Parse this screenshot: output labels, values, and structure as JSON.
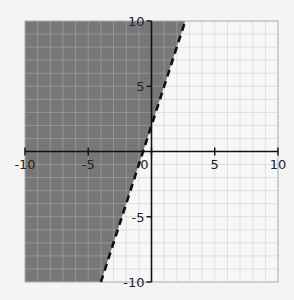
{
  "chart_data": {
    "type": "area",
    "title": "",
    "inequality": "y > 3x + 2",
    "boundary": {
      "slope": 3,
      "intercept": 2,
      "style": "dashed"
    },
    "boundary_points": [
      [
        -4,
        -10
      ],
      [
        2.67,
        10
      ]
    ],
    "xlim": [
      -10,
      10
    ],
    "ylim": [
      -10,
      10
    ],
    "x_ticks": [
      -10,
      -5,
      0,
      5,
      10
    ],
    "y_ticks": [
      -10,
      -5,
      5,
      10
    ],
    "x_tick_labels": [
      "-10",
      "-5",
      "0",
      "5",
      "10"
    ],
    "y_tick_labels": [
      "-10",
      "-5",
      "5",
      "10"
    ],
    "grid": true,
    "grid_step": 1,
    "xlabel": "",
    "ylabel": ""
  },
  "colors": {
    "background": "#f4f4f4",
    "shade": "#777777",
    "grid": "#cfcfcf",
    "grid_on_shade": "#8a8a8a",
    "axis": "#111111"
  }
}
